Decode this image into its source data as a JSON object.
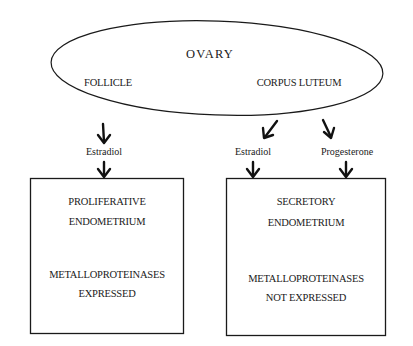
{
  "ovary": {
    "title": "OVARY",
    "left_label": "FOLLICLE",
    "right_label": "CORPUS LUTEUM"
  },
  "hormones": {
    "left": "Estradiol",
    "right_estradiol": "Estradiol",
    "right_progesterone": "Progesterone"
  },
  "left_box": {
    "line1": "PROLIFERATIVE",
    "line2": "ENDOMETRIUM",
    "line3": "METALLOPROTEINASES",
    "line4": "EXPRESSED"
  },
  "right_box": {
    "line1": "SECRETORY",
    "line2": "ENDOMETRIUM",
    "line3": "METALLOPROTEINASES",
    "line4": "NOT EXPRESSED"
  },
  "colors": {
    "stroke": "#1a1a1a",
    "background": "#ffffff"
  }
}
